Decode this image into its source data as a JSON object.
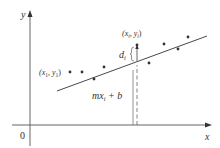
{
  "figure": {
    "axes": {
      "x_label": "x",
      "y_label": "y",
      "origin_label": "0",
      "color": "#555555"
    },
    "line": {
      "label": "mx",
      "label_sub": "i",
      "label_suffix": " + b",
      "x1": 57,
      "y1": 91,
      "x2": 207,
      "y2": 36,
      "color": "#333333"
    },
    "points": [
      {
        "x": 70,
        "y": 72
      },
      {
        "x": 82,
        "y": 72
      },
      {
        "x": 94,
        "y": 79
      },
      {
        "x": 104,
        "y": 67
      },
      {
        "x": 137,
        "y": 45
      },
      {
        "x": 149,
        "y": 63
      },
      {
        "x": 164,
        "y": 44
      },
      {
        "x": 178,
        "y": 49
      },
      {
        "x": 188,
        "y": 37
      }
    ],
    "point_labels": {
      "first": {
        "open": "(x",
        "sub1": "1",
        "mid": ", y",
        "sub2": "1",
        "close": ")"
      },
      "ith": {
        "open": "(x",
        "sub1": "i",
        "mid": ", y",
        "sub2": "i",
        "close": ")"
      }
    },
    "deviation": {
      "label": "d",
      "label_sub": "i"
    },
    "colors": {
      "axis": "#555555",
      "line": "#333333",
      "point": "#333333",
      "dashed": "#666666"
    }
  }
}
